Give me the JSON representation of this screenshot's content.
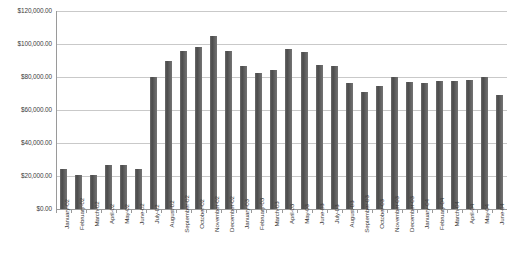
{
  "chart_data": {
    "type": "bar",
    "title": "",
    "subtitle": "",
    "xlabel": "",
    "ylabel": "",
    "ylim": [
      0,
      120000
    ],
    "ytick_values": [
      0,
      20000,
      40000,
      60000,
      80000,
      100000,
      120000
    ],
    "ytick_labels": [
      "$0.00",
      "$20,000.00",
      "$40,000.00",
      "$60,000.00",
      "$80,000.00",
      "$100,000.00",
      "$120,000.00"
    ],
    "grid": true,
    "legend": "none",
    "orientation": "vertical",
    "bar_color": "#595959",
    "gridline_color": "#c9c9c9",
    "axis_color": "#9a9a9a",
    "categories": [
      "January-02",
      "February-02",
      "March-02",
      "April-02",
      "May-02",
      "June-02",
      "July-02",
      "August-02",
      "September-02",
      "October-02",
      "November-02",
      "December-02",
      "January-03",
      "February-03",
      "March-03",
      "April-03",
      "May-03",
      "June-03",
      "July-03",
      "August-03",
      "September-03",
      "October-03",
      "November-03",
      "December-03",
      "January-04",
      "February-04",
      "March-04",
      "April-04",
      "May-04",
      "June-04"
    ],
    "values": [
      24500,
      20500,
      20500,
      26500,
      26500,
      24500,
      80000,
      89500,
      95500,
      98000,
      105000,
      96000,
      86500,
      82500,
      84500,
      97000,
      95000,
      87000,
      86500,
      76500,
      71000,
      74500,
      80000,
      77000,
      76500,
      77500,
      77500,
      78000,
      80000,
      69000
    ]
  }
}
